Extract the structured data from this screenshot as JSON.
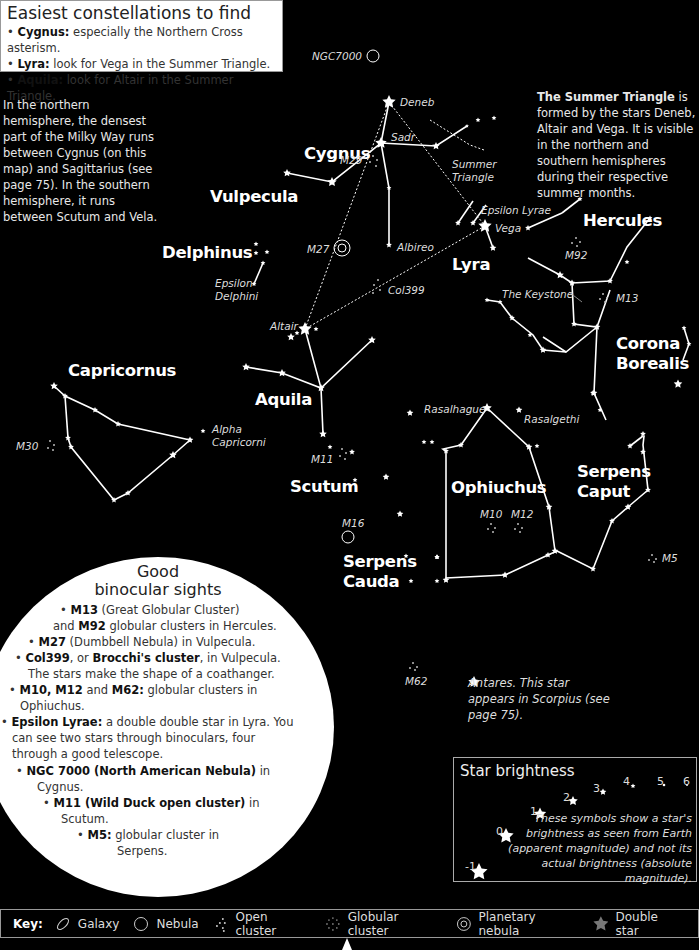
{
  "easiest": {
    "title": "Easiest constellations to find",
    "items": [
      {
        "bold": "Cygnus:",
        "text": " especially the Northern Cross asterism."
      },
      {
        "bold": "Lyra:",
        "text": " look for Vega in the Summer Triangle."
      },
      {
        "bold": "Aquila:",
        "text": " look for Altair in the Summer Triangle."
      }
    ]
  },
  "milky_way_note": "In the northern hemisphere, the densest part of the Milky Way runs between Cygnus (on this map) and Sagittarius (see page 75). In the southern hemisphere, it runs between Scutum and Vela.",
  "summer_triangle_note": {
    "bold": "The Summer Triangle",
    "text": " is formed by the stars Deneb, Altair and Vega. It is visible in the northern and southern hemispheres during their respective summer months."
  },
  "constellations": {
    "cygnus": "Cygnus",
    "vulpecula": "Vulpecula",
    "delphinus": "Delphinus",
    "lyra": "Lyra",
    "hercules": "Hercules",
    "corona1": "Corona",
    "corona2": "Borealis",
    "capricornus": "Capricornus",
    "aquila": "Aquila",
    "scutum": "Scutum",
    "ophiuchus": "Ophiuchus",
    "serpens_caput1": "Serpens",
    "serpens_caput2": "Caput",
    "serpens_cauda1": "Serpens",
    "serpens_cauda2": "Cauda"
  },
  "labels": {
    "ngc7000": "NGC7000",
    "deneb": "Deneb",
    "sadr": "Sadr",
    "m29": "M29",
    "summer1": "Summer",
    "summer2": "Triangle",
    "epsilon_lyrae": "Epsilon Lyrae",
    "vega": "Vega",
    "albireo": "Albireo",
    "m27": "M27",
    "col399": "Col399",
    "epsilon_delphini1": "Epsilon",
    "epsilon_delphini2": "Delphini",
    "altair": "Altair",
    "m92": "M92",
    "m13": "M13",
    "keystone": "The Keystone",
    "alpha_cap1": "Alpha",
    "alpha_cap2": "Capricorni",
    "m30": "M30",
    "m11": "M11",
    "rasalhague": "Rasalhague",
    "rasalgethi": "Rasalgethi",
    "m10": "M10",
    "m12": "M12",
    "m16": "M16",
    "m5": "M5",
    "m62": "M62"
  },
  "antares_note": "Antares. This star appears in Scorpius (see page 75).",
  "binocular": {
    "title1": "Good",
    "title2": "binocular sights",
    "lines": [
      {
        "bold": "M13",
        "text": " (Great Globular Cluster)"
      },
      {
        "pre": "and ",
        "bold": "M92",
        "text": " globular clusters in Hercules."
      },
      {
        "bold": "M27",
        "text": " (Dumbbell Nebula) in Vulpecula."
      },
      {
        "bold": "Col399",
        "text": ", or ",
        "bold2": "Brocchi's cluster",
        "text2": ", in Vulpecula."
      },
      {
        "text": "The stars make the shape of a coathanger."
      },
      {
        "bold": "M10, M12",
        "text": " and ",
        "bold2": "M62:",
        "text2": " globular clusters in"
      },
      {
        "text": "Ophiuchus."
      },
      {
        "bold": "Epsilon Lyrae:",
        "text": " a double double star in Lyra. You"
      },
      {
        "text": "can see two stars through binoculars, four"
      },
      {
        "text": "through a good telescope."
      },
      {
        "bold": "NGC 7000 (North American Nebula)",
        "text": " in"
      },
      {
        "text": "Cygnus."
      },
      {
        "bold": "M11 (Wild Duck open cluster)",
        "text": " in"
      },
      {
        "text": "Scutum."
      },
      {
        "bold": "M5:",
        "text": " globular cluster in"
      },
      {
        "text": "Serpens."
      }
    ]
  },
  "brightness": {
    "title": "Star brightness",
    "magnitudes": [
      "-1",
      "0",
      "1",
      "2",
      "3",
      "4",
      "5",
      "6"
    ],
    "description": "These symbols show a star's brightness as seen from Earth (apparent magnitude) and not its actual brightness (absolute magnitude)."
  },
  "key": {
    "label": "Key:",
    "items": [
      {
        "icon": "galaxy-icon",
        "label": "Galaxy"
      },
      {
        "icon": "nebula-icon",
        "label": "Nebula"
      },
      {
        "icon": "open-cluster-icon",
        "label": "Open cluster"
      },
      {
        "icon": "globular-cluster-icon",
        "label": "Globular cluster"
      },
      {
        "icon": "planetary-nebula-icon",
        "label": "Planetary nebula"
      },
      {
        "icon": "double-star-icon",
        "label": "Double star"
      }
    ]
  },
  "colors": {
    "background": "#000000",
    "foreground": "#ffffff",
    "panel": "#ffffff",
    "double_star": "#777777"
  }
}
